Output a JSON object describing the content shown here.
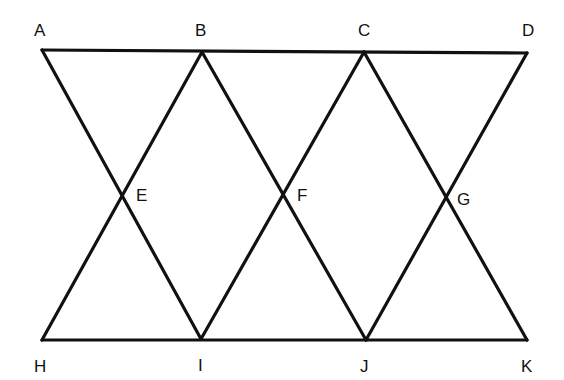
{
  "diagram": {
    "type": "geometry-figure",
    "points": [
      {
        "id": "A",
        "label": "A"
      },
      {
        "id": "B",
        "label": "B"
      },
      {
        "id": "C",
        "label": "C"
      },
      {
        "id": "D",
        "label": "D"
      },
      {
        "id": "E",
        "label": "E"
      },
      {
        "id": "F",
        "label": "F"
      },
      {
        "id": "G",
        "label": "G"
      },
      {
        "id": "H",
        "label": "H"
      },
      {
        "id": "I",
        "label": "I"
      },
      {
        "id": "J",
        "label": "J"
      },
      {
        "id": "K",
        "label": "K"
      }
    ],
    "segments": [
      [
        "A",
        "D"
      ],
      [
        "H",
        "K"
      ],
      [
        "A",
        "I"
      ],
      [
        "B",
        "H"
      ],
      [
        "B",
        "J"
      ],
      [
        "C",
        "I"
      ],
      [
        "C",
        "K"
      ],
      [
        "D",
        "J"
      ]
    ],
    "intersections": [
      {
        "point": "E",
        "of": [
          [
            "A",
            "I"
          ],
          [
            "B",
            "H"
          ]
        ]
      },
      {
        "point": "F",
        "of": [
          [
            "B",
            "J"
          ],
          [
            "C",
            "I"
          ]
        ]
      },
      {
        "point": "G",
        "of": [
          [
            "C",
            "K"
          ],
          [
            "D",
            "J"
          ]
        ]
      }
    ],
    "line_color": "#111111",
    "background": "#ffffff"
  }
}
